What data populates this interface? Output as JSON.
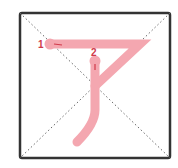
{
  "diagram": {
    "type": "stroke-order",
    "character": "ア",
    "grid": {
      "box": {
        "x": 20,
        "y": 13,
        "w": 150,
        "h": 145
      },
      "border_color": "#333333",
      "guide_color": "#666666",
      "guides": "diagonal-dotted"
    },
    "stroke_color": "#f4a7b0",
    "label_color": "#d03a4a",
    "strokes": [
      {
        "number": "1",
        "label_pos": {
          "x": 38,
          "y": 48
        },
        "path": "M50 44 L140 44 L95 86",
        "start": {
          "x": 50,
          "y": 44
        },
        "direction_tick": "M54 44 L62 45"
      },
      {
        "number": "2",
        "label_pos": {
          "x": 91,
          "y": 56
        },
        "path": "M95 61 L95 110 Q95 124 77 142",
        "start": {
          "x": 95,
          "y": 61
        },
        "direction_tick": "M95 64 L95 70"
      }
    ]
  }
}
